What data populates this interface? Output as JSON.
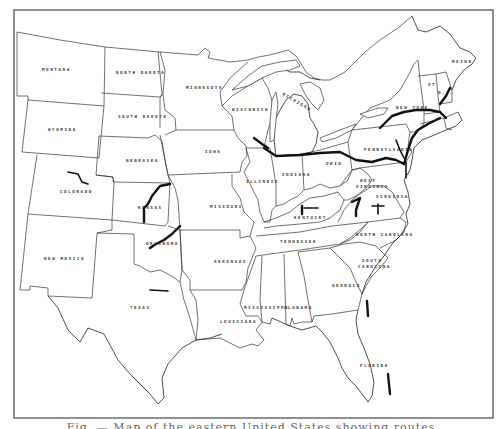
{
  "map": {
    "title": "",
    "caption": "Fig. — Map of the eastern United States showing routes",
    "colors": {
      "background": "#ffffff",
      "state_lines": "#333333",
      "routes": "#111111",
      "frame": "#555555"
    },
    "states": [
      {
        "name": "MONTANA",
        "x": 42,
        "y": 71
      },
      {
        "name": "NORTH DAKOTA",
        "x": 120,
        "y": 74
      },
      {
        "name": "SOUTH DAKOTA",
        "x": 124,
        "y": 118
      },
      {
        "name": "WYOMING",
        "x": 52,
        "y": 131
      },
      {
        "name": "NEBRASKA",
        "x": 130,
        "y": 162
      },
      {
        "name": "COLORADO",
        "x": 66,
        "y": 193
      },
      {
        "name": "KANSAS",
        "x": 144,
        "y": 208
      },
      {
        "name": "NEW MEXICO",
        "x": 48,
        "y": 260
      },
      {
        "name": "OKLAHOMA",
        "x": 150,
        "y": 245
      },
      {
        "name": "TEXAS",
        "x": 134,
        "y": 308
      },
      {
        "name": "MINNESOTA",
        "x": 194,
        "y": 89
      },
      {
        "name": "IOWA",
        "x": 208,
        "y": 153
      },
      {
        "name": "MISSOURI",
        "x": 212,
        "y": 208
      },
      {
        "name": "ARKANSAS",
        "x": 224,
        "y": 263
      },
      {
        "name": "LOUISIANA",
        "x": 232,
        "y": 322
      },
      {
        "name": "WISCONSIN",
        "x": 238,
        "y": 110
      },
      {
        "name": "ILLINOIS",
        "x": 260,
        "y": 183
      },
      {
        "name": "INDIANA",
        "x": 288,
        "y": 176
      },
      {
        "name": "MICHIGAN",
        "x": 282,
        "y": 97
      },
      {
        "name": "OHIO",
        "x": 330,
        "y": 165
      },
      {
        "name": "KENTUCKY",
        "x": 302,
        "y": 218
      },
      {
        "name": "TENNESSEE",
        "x": 286,
        "y": 243
      },
      {
        "name": "MISSISSIPPI",
        "x": 264,
        "y": 309
      },
      {
        "name": "ALABAMA",
        "x": 296,
        "y": 309
      },
      {
        "name": "GEORGIA",
        "x": 336,
        "y": 286
      },
      {
        "name": "FLORIDA",
        "x": 365,
        "y": 367
      },
      {
        "name": "SOUTH",
        "x": 365,
        "y": 262
      },
      {
        "name": "CAROLINA",
        "x": 362,
        "y": 268
      },
      {
        "name": "NORTH CAROLINA",
        "x": 363,
        "y": 236
      },
      {
        "name": "VIRGINIA",
        "x": 380,
        "y": 198
      },
      {
        "name": "WEST",
        "x": 362,
        "y": 182
      },
      {
        "name": "VIRGINIA",
        "x": 360,
        "y": 188
      },
      {
        "name": "PENNSYLVANIA",
        "x": 372,
        "y": 151
      },
      {
        "name": "NEW YORK",
        "x": 400,
        "y": 109
      },
      {
        "name": "VT",
        "x": 430,
        "y": 86
      },
      {
        "name": "N.H.",
        "x": 440,
        "y": 94
      },
      {
        "name": "MAINE",
        "x": 456,
        "y": 63
      }
    ],
    "routes_note": "Bold black lines indicate routes"
  }
}
